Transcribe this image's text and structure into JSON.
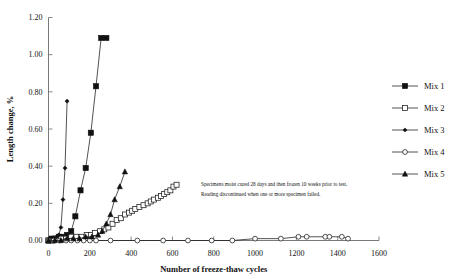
{
  "chart_data": {
    "type": "line",
    "title": "",
    "xlabel": "Number of freeze-thaw cycles",
    "ylabel": "Length change, %",
    "xlim": [
      0,
      1600
    ],
    "ylim": [
      0,
      1.2
    ],
    "xticks": [
      0,
      200,
      400,
      600,
      800,
      1000,
      1200,
      1400,
      1600
    ],
    "xtick_labels": [
      "0",
      "200",
      "400",
      "600",
      "800",
      "1000",
      "1200",
      "1400",
      "1600"
    ],
    "yticks": [
      0.0,
      0.2,
      0.4,
      0.6,
      0.8,
      1.0,
      1.2
    ],
    "ytick_labels": [
      "0.00",
      "0.20",
      "0.40",
      "0.60",
      "0.80",
      "1.00",
      "1.20"
    ],
    "grid": false,
    "legend_position": "right",
    "series": [
      {
        "name": "Mix 1",
        "marker": "filled-square",
        "x": [
          0,
          15,
          30,
          50,
          70,
          90,
          110,
          130,
          155,
          180,
          205,
          230,
          255,
          280
        ],
        "y": [
          0.0,
          0.01,
          0.01,
          0.02,
          0.02,
          0.03,
          0.05,
          0.13,
          0.27,
          0.39,
          0.58,
          0.83,
          1.09,
          1.09
        ]
      },
      {
        "name": "Mix 2",
        "marker": "open-square",
        "x": [
          0,
          20,
          40,
          60,
          85,
          110,
          135,
          160,
          185,
          205,
          225,
          250,
          270,
          290,
          310,
          330,
          350,
          370,
          390,
          405,
          420,
          440,
          460,
          480,
          495,
          510,
          530,
          545,
          560,
          575,
          590,
          605,
          620
        ],
        "y": [
          0.0,
          0.0,
          0.01,
          0.01,
          0.01,
          0.02,
          0.02,
          0.02,
          0.03,
          0.03,
          0.04,
          0.05,
          0.06,
          0.07,
          0.09,
          0.11,
          0.12,
          0.14,
          0.15,
          0.16,
          0.17,
          0.18,
          0.19,
          0.2,
          0.21,
          0.22,
          0.23,
          0.24,
          0.25,
          0.26,
          0.27,
          0.29,
          0.3
        ]
      },
      {
        "name": "Mix 3",
        "marker": "filled-diamond",
        "x": [
          0,
          10,
          20,
          30,
          40,
          50,
          60,
          70,
          80,
          90
        ],
        "y": [
          0.0,
          0.0,
          0.01,
          0.01,
          0.02,
          0.03,
          0.07,
          0.22,
          0.39,
          0.75
        ]
      },
      {
        "name": "Mix 4",
        "marker": "open-circle",
        "x": [
          0,
          25,
          55,
          85,
          110,
          140,
          170,
          200,
          230,
          300,
          430,
          555,
          675,
          790,
          890,
          1000,
          1125,
          1210,
          1250,
          1340,
          1360,
          1420,
          1450
        ],
        "y": [
          0.0,
          0.0,
          0.0,
          0.0,
          0.0,
          0.0,
          0.0,
          0.0,
          0.0,
          0.0,
          0.0,
          0.0,
          0.0,
          0.0,
          0.0,
          0.01,
          0.01,
          0.02,
          0.02,
          0.02,
          0.02,
          0.02,
          0.01
        ]
      },
      {
        "name": "Mix 5",
        "marker": "filled-triangle",
        "x": [
          0,
          30,
          60,
          90,
          120,
          150,
          180,
          210,
          240,
          260,
          280,
          300,
          320,
          345,
          370
        ],
        "y": [
          0.0,
          0.0,
          0.0,
          0.01,
          0.01,
          0.01,
          0.02,
          0.02,
          0.03,
          0.05,
          0.09,
          0.14,
          0.22,
          0.29,
          0.37
        ]
      }
    ],
    "annotations": [
      "Specimens moist cured 28 days and then frozen 10 weeks prior to test.",
      "Reading discontinued when one or more specimen failed."
    ]
  },
  "legend": {
    "entries": [
      {
        "label": "Mix 1"
      },
      {
        "label": "Mix 2"
      },
      {
        "label": "Mix 3"
      },
      {
        "label": "Mix 4"
      },
      {
        "label": "Mix 5"
      }
    ]
  }
}
